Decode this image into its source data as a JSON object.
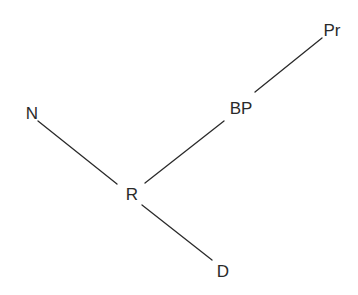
{
  "diagram": {
    "type": "tree",
    "colors": {
      "line": "#2a2a2a",
      "text": "#2a2a2a",
      "background": "#ffffff"
    },
    "nodes": [
      {
        "id": "N",
        "label": "N",
        "x": 32,
        "y": 113
      },
      {
        "id": "R",
        "label": "R",
        "x": 132,
        "y": 194
      },
      {
        "id": "BP",
        "label": "BP",
        "x": 241,
        "y": 108
      },
      {
        "id": "Pr",
        "label": "Pr",
        "x": 332,
        "y": 30
      },
      {
        "id": "D",
        "label": "D",
        "x": 223,
        "y": 271
      }
    ],
    "edges": [
      {
        "from": "N",
        "to": "R",
        "x1": 38,
        "y1": 121,
        "x2": 117,
        "y2": 184
      },
      {
        "from": "R",
        "to": "BP",
        "x1": 145,
        "y1": 183,
        "x2": 224,
        "y2": 121
      },
      {
        "from": "BP",
        "to": "Pr",
        "x1": 255,
        "y1": 92,
        "x2": 322,
        "y2": 38
      },
      {
        "from": "R",
        "to": "D",
        "x1": 142,
        "y1": 205,
        "x2": 212,
        "y2": 260
      }
    ]
  }
}
